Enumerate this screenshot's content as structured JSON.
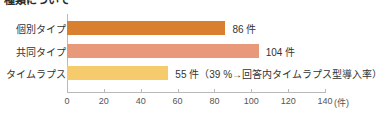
{
  "chart_data": {
    "type": "bar",
    "orientation": "horizontal",
    "title": "種類について",
    "categories": [
      "個別タイプ",
      "共同タイプ",
      "タイムラプス"
    ],
    "values": [
      86,
      104,
      55
    ],
    "value_labels": [
      "86 件",
      "104 件",
      "55 件（39 %→回答内タイムラプス型導入率）"
    ],
    "colors": [
      "#D98030",
      "#E8997A",
      "#F5CB6B"
    ],
    "xlabel": "(件)",
    "ylabel": "",
    "xlim": [
      0,
      140
    ],
    "xticks": [
      0,
      20,
      40,
      60,
      80,
      100,
      120,
      140
    ],
    "xtick_labels": [
      "0",
      "20",
      "40",
      "60",
      "80",
      "100",
      "120",
      "140"
    ],
    "grid": false,
    "legend": false,
    "annotations": [
      "39 %→回答内タイムラプス型導入率"
    ]
  },
  "axis": {
    "unit_suffix": "(件)"
  }
}
